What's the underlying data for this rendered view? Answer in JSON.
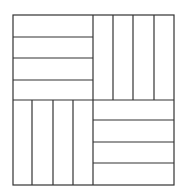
{
  "diagram": {
    "type": "parquet-pattern",
    "stroke_color": "#333333",
    "background": "#ffffff",
    "outer": {
      "x1": 13,
      "y1": 15,
      "x2": 174,
      "y2": 185
    },
    "center": {
      "x": 93,
      "y": 100
    },
    "quadrants": {
      "top_left": {
        "orientation": "horizontal",
        "strips": 4,
        "lines": [
          37,
          58,
          80
        ]
      },
      "top_right": {
        "orientation": "vertical",
        "strips": 4,
        "lines": [
          113,
          133,
          154
        ]
      },
      "bottom_left": {
        "orientation": "vertical",
        "strips": 4,
        "lines": [
          32,
          53,
          73
        ]
      },
      "bottom_right": {
        "orientation": "horizontal",
        "strips": 4,
        "lines": [
          120,
          142,
          163
        ]
      }
    }
  }
}
